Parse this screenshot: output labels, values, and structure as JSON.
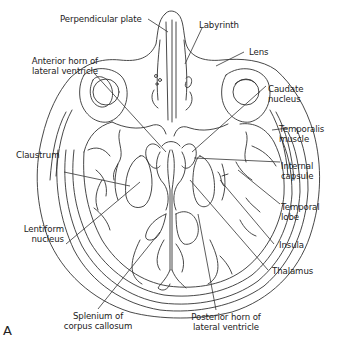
{
  "figure": {
    "panel_letter": "A",
    "labels": {
      "perpendicular_plate": "Perpendicular plate",
      "labyrinth": "Labyrinth",
      "lens": "Lens",
      "anterior_horn_1": "Anterior horn of",
      "anterior_horn_2": "lateral ventricle",
      "caudate_1": "Caudate",
      "caudate_2": "nucleus",
      "temporalis_1": "Temporalis",
      "temporalis_2": "muscle",
      "claustrum": "Claustrum",
      "internal_capsule_1": "Internal",
      "internal_capsule_2": "capsule",
      "temporal_lobe_1": "Temporal",
      "temporal_lobe_2": "lobe",
      "lentiform_1": "Lentiform",
      "lentiform_2": "nucleus",
      "insula": "Insula",
      "thalamus": "Thalamus",
      "splenium_1": "Splenium of",
      "splenium_2": "corpus callosum",
      "posterior_horn_1": "Posterior horn of",
      "posterior_horn_2": "lateral ventricle"
    }
  }
}
